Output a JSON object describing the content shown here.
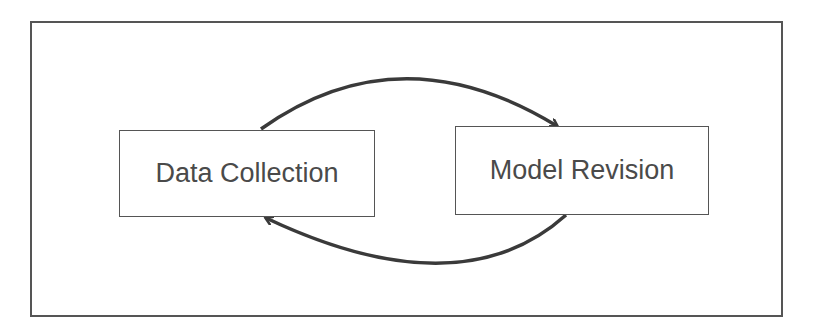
{
  "diagram": {
    "type": "cycle",
    "nodes": [
      {
        "id": "data-collection",
        "label": "Data Collection"
      },
      {
        "id": "model-revision",
        "label": "Model Revision"
      }
    ],
    "edges": [
      {
        "from": "data-collection",
        "to": "model-revision",
        "style": "curved-arrow-over"
      },
      {
        "from": "model-revision",
        "to": "data-collection",
        "style": "curved-arrow-under"
      }
    ],
    "colors": {
      "stroke": "#555555",
      "arrow": "#3a3a3a",
      "text": "#4a4a4a",
      "background": "#ffffff"
    }
  }
}
